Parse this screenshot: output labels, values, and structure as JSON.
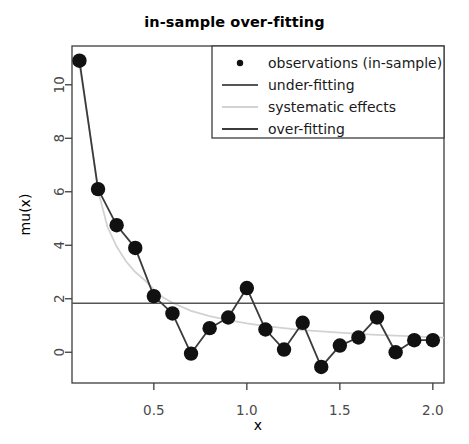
{
  "chart_data": {
    "type": "scatter",
    "title": "in-sample over-fitting",
    "xlabel": "x",
    "ylabel": "mu(x)",
    "xlim": [
      0.06,
      2.06
    ],
    "ylim": [
      -1.15,
      11.45
    ],
    "xticks": [
      0.5,
      1.0,
      1.5,
      2.0
    ],
    "xtick_labels": [
      "0.5",
      "1.0",
      "1.5",
      "2.0"
    ],
    "yticks": [
      0,
      2,
      4,
      6,
      8,
      10
    ],
    "ytick_labels": [
      "0",
      "2",
      "4",
      "6",
      "8",
      "10"
    ],
    "grid": false,
    "legend_position": "top-right",
    "series": [
      {
        "name": "observations (in-sample)",
        "type": "scatter",
        "marker": "filled-circle",
        "color": "#111111",
        "x": [
          0.1,
          0.2,
          0.3,
          0.4,
          0.5,
          0.6,
          0.7,
          0.8,
          0.9,
          1.0,
          1.1,
          1.2,
          1.3,
          1.4,
          1.5,
          1.6,
          1.7,
          1.8,
          1.9,
          2.0
        ],
        "y": [
          10.9,
          6.1,
          4.75,
          3.9,
          2.1,
          1.45,
          -0.05,
          0.9,
          1.3,
          2.4,
          0.85,
          0.1,
          1.1,
          -0.55,
          0.25,
          0.55,
          1.3,
          0.0,
          0.45,
          0.45
        ]
      },
      {
        "name": "under-fitting",
        "type": "line",
        "color": "#555555",
        "x": [
          0.06,
          2.06
        ],
        "y": [
          1.83,
          1.83
        ]
      },
      {
        "name": "systematic effects",
        "type": "line",
        "color": "#d2d2d2",
        "x": [
          0.1,
          0.15,
          0.2,
          0.25,
          0.3,
          0.35,
          0.4,
          0.45,
          0.5,
          0.55,
          0.6,
          0.7,
          0.8,
          0.9,
          1.0,
          1.1,
          1.2,
          1.3,
          1.4,
          1.5,
          1.6,
          1.7,
          1.8,
          1.9,
          2.0,
          2.06
        ],
        "y": [
          10.75,
          8.5,
          6.05,
          4.7,
          3.95,
          3.4,
          3.0,
          2.7,
          2.35,
          2.05,
          1.85,
          1.55,
          1.35,
          1.2,
          1.08,
          0.98,
          0.9,
          0.83,
          0.78,
          0.73,
          0.69,
          0.65,
          0.62,
          0.59,
          0.56,
          0.55
        ]
      },
      {
        "name": "over-fitting",
        "type": "line",
        "color": "#3b3b3b",
        "x": [
          0.1,
          0.2,
          0.3,
          0.4,
          0.5,
          0.6,
          0.7,
          0.8,
          0.9,
          1.0,
          1.1,
          1.2,
          1.3,
          1.4,
          1.5,
          1.6,
          1.7,
          1.8,
          1.9,
          2.0
        ],
        "y": [
          10.9,
          6.1,
          4.75,
          3.9,
          2.1,
          1.45,
          -0.05,
          0.9,
          1.3,
          2.4,
          0.85,
          0.1,
          1.1,
          -0.55,
          0.25,
          0.55,
          1.3,
          0.0,
          0.45,
          0.45
        ]
      }
    ],
    "legend_entries": [
      {
        "label": "observations (in-sample)",
        "marker": "point",
        "color": "#111111"
      },
      {
        "label": "under-fitting",
        "marker": "line",
        "color": "#555555"
      },
      {
        "label": "systematic effects",
        "marker": "line",
        "color": "#d2d2d2"
      },
      {
        "label": "over-fitting",
        "marker": "line",
        "color": "#3b3b3b"
      }
    ]
  }
}
